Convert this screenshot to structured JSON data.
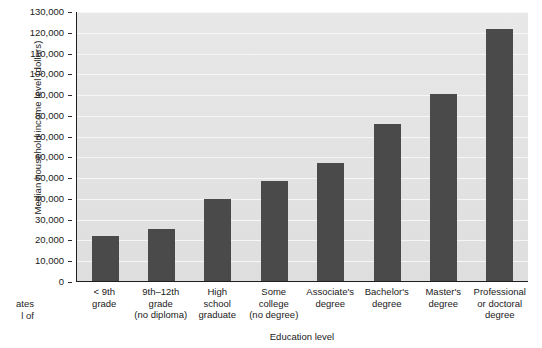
{
  "chart_data": {
    "type": "bar",
    "title": "",
    "xlabel": "Education level",
    "ylabel": "Median household income level (dollars)",
    "categories": [
      "< 9th\ngrade",
      "9th–12th\ngrade\n(no diploma)",
      "High\nschool\ngraduate",
      "Some\ncollege\n(no degree)",
      "Associate's\ndegree",
      "Bachelor's\ndegree",
      "Master's\ndegree",
      "Professional\nor doctoral\ndegree"
    ],
    "values": [
      21500,
      25000,
      39500,
      48000,
      57000,
      75500,
      90000,
      121500
    ],
    "ylim": [
      0,
      130000
    ],
    "ytick_values": [
      0,
      10000,
      20000,
      30000,
      40000,
      50000,
      60000,
      70000,
      80000,
      90000,
      100000,
      110000,
      120000,
      130000
    ],
    "ytick_labels": [
      "0",
      "10,000",
      "20,000",
      "30,000",
      "40,000",
      "50,000",
      "60,000",
      "70,000",
      "80,000",
      "90,000",
      "100,000",
      "110,000",
      "120,000",
      "130,000"
    ],
    "grid": true,
    "legend": false,
    "bar_color": "#4a4a4a",
    "plot_background": "#e4e4e4",
    "gridline_color": "#f6f6f6",
    "axis_color": "#1f1f1f"
  },
  "caption_remnant": "ates\nl of"
}
